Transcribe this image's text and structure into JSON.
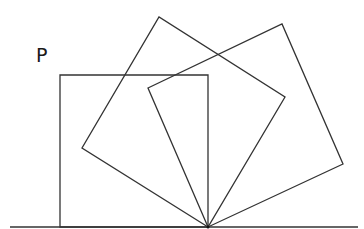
{
  "diagram": {
    "type": "geometry-rotation",
    "stroke_color": "#333333",
    "background": "#ffffff",
    "label": {
      "text": "P",
      "x": 36,
      "y": 46
    },
    "ground_line": {
      "x1": 10,
      "y1": 227,
      "x2": 358,
      "y2": 227
    },
    "pivot": {
      "x": 208,
      "y": 227
    },
    "squares": [
      {
        "name": "upright-square",
        "points": "208,227 60,227 60,75 208,75"
      },
      {
        "name": "rotated-square-1",
        "points": "208,227 82,148 159,17 285,97"
      },
      {
        "name": "rotated-square-2",
        "points": "208,227 148,88 282,24 343,164"
      }
    ]
  }
}
